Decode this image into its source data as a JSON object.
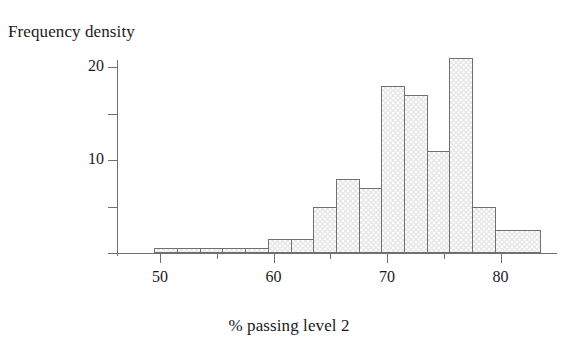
{
  "chart_data": {
    "type": "bar",
    "title": "",
    "subtitle": "",
    "xlabel": "% passing level 2",
    "ylabel": "Frequency density",
    "grid": false,
    "legend": null,
    "xlim": [
      46,
      86
    ],
    "ylim": [
      0,
      22.5
    ],
    "x_major_ticks": [
      50,
      60,
      70,
      80
    ],
    "x_major_tick_labels": [
      "50",
      "60",
      "70",
      "80"
    ],
    "x_minor_ticks": [
      55,
      65,
      75
    ],
    "y_ticks": [
      5,
      10,
      15,
      20
    ],
    "y_tick_labels": [
      "",
      "10",
      "",
      "20"
    ],
    "bin_width": 2,
    "bins": [
      {
        "start": 49.5,
        "end": 51.5,
        "value": 0.5
      },
      {
        "start": 51.5,
        "end": 53.5,
        "value": 0.5
      },
      {
        "start": 53.5,
        "end": 55.5,
        "value": 0.5
      },
      {
        "start": 55.5,
        "end": 57.5,
        "value": 0.5
      },
      {
        "start": 57.5,
        "end": 59.5,
        "value": 0.5
      },
      {
        "start": 59.5,
        "end": 61.5,
        "value": 1.5
      },
      {
        "start": 61.5,
        "end": 63.5,
        "value": 1.5
      },
      {
        "start": 63.5,
        "end": 65.5,
        "value": 5
      },
      {
        "start": 65.5,
        "end": 67.5,
        "value": 8
      },
      {
        "start": 67.5,
        "end": 69.5,
        "value": 7
      },
      {
        "start": 69.5,
        "end": 71.5,
        "value": 18
      },
      {
        "start": 71.5,
        "end": 73.5,
        "value": 17
      },
      {
        "start": 73.5,
        "end": 75.5,
        "value": 11
      },
      {
        "start": 75.5,
        "end": 77.5,
        "value": 21
      },
      {
        "start": 77.5,
        "end": 79.5,
        "value": 5
      },
      {
        "start": 79.5,
        "end": 83.5,
        "value": 2.5
      }
    ],
    "categories": [
      "49.5-51.5",
      "51.5-53.5",
      "53.5-55.5",
      "55.5-57.5",
      "57.5-59.5",
      "59.5-61.5",
      "61.5-63.5",
      "63.5-65.5",
      "65.5-67.5",
      "67.5-69.5",
      "69.5-71.5",
      "71.5-73.5",
      "73.5-75.5",
      "75.5-77.5",
      "77.5-79.5",
      "79.5-83.5"
    ],
    "values": [
      0.5,
      0.5,
      0.5,
      0.5,
      0.5,
      1.5,
      1.5,
      5,
      8,
      7,
      18,
      17,
      11,
      21,
      5,
      2.5
    ],
    "colors": {
      "bar_fill": "#e9e9e9",
      "bar_edge": "#707070",
      "axis": "#6f6f6f",
      "text": "#1a1a1a"
    }
  }
}
